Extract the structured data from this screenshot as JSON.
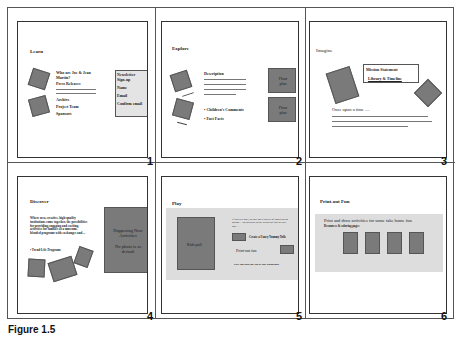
{
  "caption": "Figure 1.5",
  "slides": [
    {
      "number": "1",
      "title": "Learn",
      "links": [
        "Who are Joe & Jean Martin?",
        "Press Releases",
        "Archive",
        "Project Team",
        "Sponsors"
      ],
      "newsletter": {
        "heading": "Newsletter Sign-up",
        "fields": [
          "Name",
          "Email",
          "Confirm email"
        ]
      }
    },
    {
      "number": "2",
      "title": "Explore",
      "description_label": "Description",
      "bullets": [
        "• Children's Comments",
        "• Fast Facts"
      ],
      "floor_plans": [
        "Floor plan",
        "Floor plan"
      ]
    },
    {
      "number": "3",
      "title": "Imagine",
      "box_items": [
        "Mission Statement",
        "Library & Timeline"
      ],
      "story_label": "Once upon a time ...."
    },
    {
      "number": "4",
      "title": "Discover",
      "body": "Where new, creative, high-quality institutions come together, the possibilities for providing engaging and exciting activities for families at a museum, blended programs with exchanges and ...",
      "link": "• Trend-Life Programs",
      "panel_lines": [
        "Happening Now Activities",
        "No photo is as default"
      ]
    },
    {
      "number": "5",
      "title": "Play",
      "kids_label": "Kids poll",
      "intro": "If this is a poll, to vote on a variety of topics or an option ... so children to the results of this week's poll ...",
      "game_label": "Create a Fancy Yummy Yolk",
      "printout_label": "Print-out fun",
      "footer_label": "Play dig into the Tip of the Woodland"
    },
    {
      "number": "6",
      "title": "Print-out Fun",
      "heading": "Print and draw activities for some take home fun",
      "subheading": "Resources & coloring pages",
      "cards": 4
    }
  ]
}
